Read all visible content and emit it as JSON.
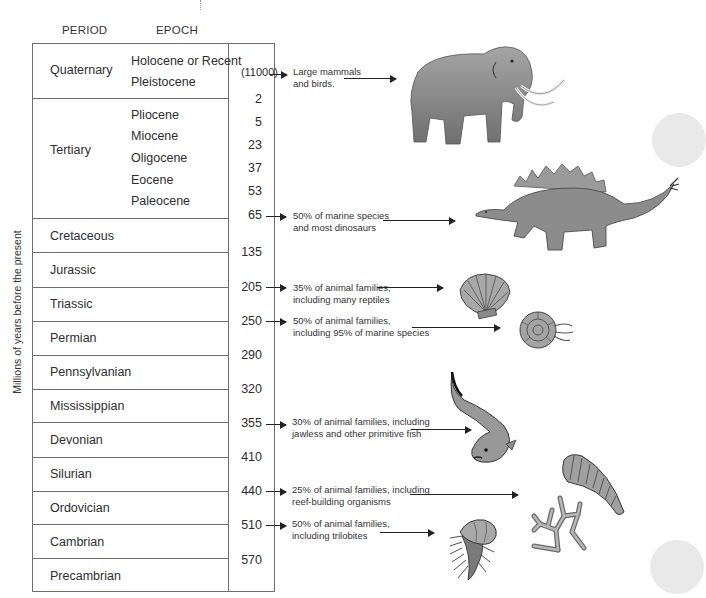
{
  "headers": {
    "period": "PERIOD",
    "epoch": "EPOCH"
  },
  "y_axis_label": "Millions of years before the present",
  "periods": [
    {
      "name": "Quaternary",
      "epochs": [
        "Holocene or Recent",
        "Pleistocene"
      ]
    },
    {
      "name": "Tertiary",
      "epochs": [
        "Pliocene",
        "Miocene",
        "Oligocene",
        "Eocene",
        "Paleocene"
      ]
    },
    {
      "name": "Cretaceous"
    },
    {
      "name": "Jurassic"
    },
    {
      "name": "Triassic"
    },
    {
      "name": "Permian"
    },
    {
      "name": "Pennsylvanian"
    },
    {
      "name": "Mississippian"
    },
    {
      "name": "Devonian"
    },
    {
      "name": "Silurian"
    },
    {
      "name": "Ordovician"
    },
    {
      "name": "Cambrian"
    },
    {
      "name": "Precambrian"
    }
  ],
  "ages": [
    "(11000)",
    "2",
    "5",
    "23",
    "37",
    "53",
    "65",
    "135",
    "205",
    "250",
    "290",
    "320",
    "355",
    "410",
    "440",
    "510",
    "570"
  ],
  "extinctions": [
    {
      "age": "(11000)",
      "line1": "Large mammals",
      "line2": "and birds.",
      "organism": "woolly mammoth"
    },
    {
      "age": "65",
      "line1": "50% of marine species",
      "line2": "and most dinosaurs",
      "organism": "stegosaurus"
    },
    {
      "age": "205",
      "line1": "35% of animal families,",
      "line2": "including many reptiles",
      "organism": "scallop shell"
    },
    {
      "age": "250",
      "line1": "50% of animal families,",
      "line2": "including 95% of marine species",
      "organism": "ammonite"
    },
    {
      "age": "355",
      "line1": "30% of animal families, including",
      "line2": "jawless and other primitive fish",
      "organism": "jawless fish"
    },
    {
      "age": "440",
      "line1": "25% of animal families, including",
      "line2": "reef-building organisms",
      "organism": "horn coral and branching coral"
    },
    {
      "age": "510",
      "line1": "50% of animal families,",
      "line2": "including trilobites",
      "organism": "trilobite"
    }
  ],
  "colors": {
    "line": "#6e6e6e",
    "text": "#2e2e2e",
    "illustration": "#8c8c8c",
    "deco": "#e9e9ea"
  }
}
